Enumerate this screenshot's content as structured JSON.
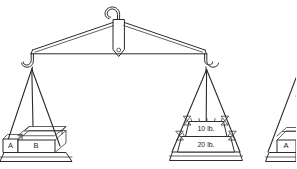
{
  "figure": {
    "type": "balance-scale-diagram",
    "title": "",
    "background_color": "#ffffff",
    "line_color": "#2b2b2b"
  },
  "suspension": {
    "hook_name": "top-suspension-hook",
    "shackle_name": "fulcrum-shackle",
    "pivot_name": "fulcrum-pivot-hole"
  },
  "beam": {
    "name": "balance-beam",
    "left_hook_label": "",
    "right_hook_label": ""
  },
  "left_pan": {
    "name": "left-balance-pan",
    "blocks": [
      {
        "label": "A",
        "name": "block-a"
      },
      {
        "label": "B",
        "name": "block-b"
      }
    ]
  },
  "right_pan": {
    "name": "right-balance-pan",
    "weights": [
      {
        "label": "10 lb.",
        "name": "weight-10lb"
      },
      {
        "label": "20 lb.",
        "name": "weight-20lb"
      }
    ]
  },
  "partial_figure": {
    "name": "partial-right-figure",
    "blocks": [
      {
        "label": "A",
        "name": "partial-block-a"
      }
    ]
  }
}
